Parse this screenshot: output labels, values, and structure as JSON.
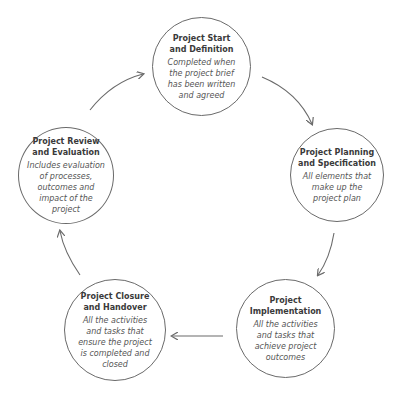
{
  "diagram": {
    "type": "cycle",
    "stages": [
      {
        "id": "start",
        "title": "Project Start\nand Definition",
        "description": "Completed when\nthe project brief\nhas been written\nand agreed"
      },
      {
        "id": "planning",
        "title": "Project Planning\nand Specification",
        "description": "All elements that\nmake up the\nproject plan"
      },
      {
        "id": "implementation",
        "title": "Project\nImplementation",
        "description": "All the activities\nand tasks that\nachieve project\noutcomes"
      },
      {
        "id": "closure",
        "title": "Project Closure\nand Handover",
        "description": "All the activities\nand tasks that\nensure the project\nis completed and\nclosed"
      },
      {
        "id": "review",
        "title": "Project Review\nand Evaluation",
        "description": "Includes evaluation\nof processes,\noutcomes and\nimpact of the\nproject"
      }
    ],
    "flow": [
      "start",
      "planning",
      "implementation",
      "closure",
      "review",
      "start"
    ],
    "colors": {
      "circle_stroke": "#6a6a6a",
      "arrow": "#6a6a6a",
      "title_text": "#3a3a3a",
      "desc_text": "#555555"
    }
  }
}
